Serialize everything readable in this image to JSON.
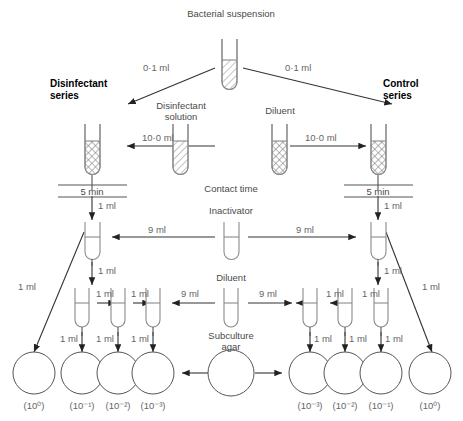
{
  "diagram": {
    "source_tube_label": "Bacterial suspension",
    "branch_left_heading": "Disinfectant\nseries",
    "branch_left_heading_line1": "Disinfectant",
    "branch_left_heading_line2": "series",
    "branch_right_heading_line1": "Control",
    "branch_right_heading_line2": "series",
    "reagent_left_line1": "Disinfectant",
    "reagent_left_line2": "solution",
    "reagent_right": "Diluent",
    "contact_time_label": "Contact time",
    "inactivator_label": "Inactivator",
    "diluent_label": "Diluent",
    "subculture_line1": "Subculture",
    "subculture_line2": "agar",
    "timer_left": "5 min",
    "timer_right": "5 min",
    "volumes": {
      "inoculum": "0·1 ml",
      "reagent": "10·0 ml",
      "inactivator": "9 ml",
      "diluent": "9 ml",
      "transfer": "1 ml"
    },
    "arrow_labels": {
      "inoculum_left": "0·1 ml",
      "inoculum_right": "0·1 ml",
      "disinfectant_add": "10·0 ml",
      "diluent_add": "10·0 ml",
      "inactivator_left": "9 ml",
      "inactivator_right": "9 ml",
      "diluent_left": "9 ml",
      "diluent_right": "9 ml",
      "drop_left_1": "1 ml",
      "drop_right_1": "1 ml",
      "serial_l1": "1 ml",
      "serial_l2": "1 ml",
      "serial_r1": "1 ml",
      "serial_r2": "1 ml",
      "plate_l0": "1 ml",
      "plate_l1": "1 ml",
      "plate_l2": "1 ml",
      "plate_l3": "1 ml",
      "plate_r3": "1 ml",
      "plate_r2": "1 ml",
      "plate_r1": "1 ml",
      "plate_r0": "1 ml",
      "diagonal_left": "1 ml",
      "diagonal_right": "1 ml"
    },
    "plates": [
      {
        "id": "left-10-0",
        "label": "(10⁰)",
        "exponent": "0"
      },
      {
        "id": "left-10-1",
        "label": "(10⁻¹)",
        "exponent": "-1"
      },
      {
        "id": "left-10-2",
        "label": "(10⁻²)",
        "exponent": "-2"
      },
      {
        "id": "left-10-3",
        "label": "(10⁻³)",
        "exponent": "-3"
      },
      {
        "id": "agar-center",
        "label": "",
        "exponent": ""
      },
      {
        "id": "right-10-3",
        "label": "(10⁻³)",
        "exponent": "-3"
      },
      {
        "id": "right-10-2",
        "label": "(10⁻²)",
        "exponent": "-2"
      },
      {
        "id": "right-10-1",
        "label": "(10⁻¹)",
        "exponent": "-1"
      },
      {
        "id": "right-10-0",
        "label": "(10⁰)",
        "exponent": "0"
      }
    ],
    "colors": {
      "line": "#333333",
      "tube_outline": "#808080",
      "plate_outline": "#555555",
      "text": "#666666",
      "text_bold": "#000000",
      "background": "#ffffff"
    }
  }
}
